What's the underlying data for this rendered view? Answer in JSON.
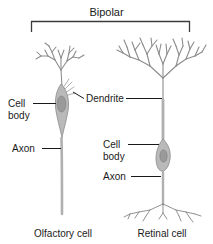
{
  "figure": {
    "title": "Bipolar",
    "background_color": "#ffffff",
    "line_color": "#8c8c8c",
    "text_color": "#1a1a1a",
    "soma_color": "#b9b9b9"
  },
  "cells": [
    {
      "caption": "Olfactory cell",
      "labels": {
        "cell_body": "Cell",
        "cell_body_second_line": "body",
        "axon": "Axon"
      }
    },
    {
      "caption": "Retinal cell",
      "labels": {
        "cell_body": "Cell",
        "cell_body_second_line": "body",
        "axon": "Axon"
      }
    }
  ],
  "shared_labels": {
    "dendrite": "Dendrite"
  }
}
